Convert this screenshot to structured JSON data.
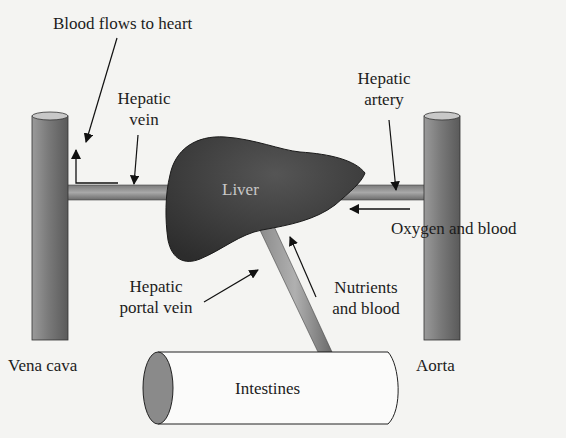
{
  "diagram": {
    "labels": {
      "blood_flows_to_heart": "Blood flows to heart",
      "hepatic_vein_line1": "Hepatic",
      "hepatic_vein_line2": "vein",
      "hepatic_artery_line1": "Hepatic",
      "hepatic_artery_line2": "artery",
      "liver": "Liver",
      "oxygen_and_blood": "Oxygen and blood",
      "hepatic_portal_vein_line1": "Hepatic",
      "hepatic_portal_vein_line2": "portal vein",
      "nutrients_and_blood_line1": "Nutrients",
      "nutrients_and_blood_line2": "and blood",
      "vena_cava": "Vena cava",
      "aorta": "Aorta",
      "intestines": "Intestines"
    },
    "colors": {
      "background": "#f4f4f2",
      "liver": "#3a3a3a",
      "vessel_dark": "#6e6e6e",
      "vessel_light": "#b4b4b4",
      "outline": "#1a1a1a",
      "intestine_end": "#8a8a8a"
    }
  }
}
